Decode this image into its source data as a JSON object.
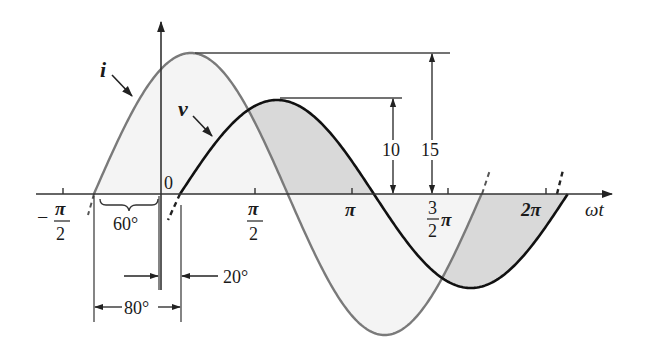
{
  "figure": {
    "type": "phasor-waveform-diagram",
    "axis": {
      "x_label": "ωt",
      "origin_label": "0",
      "ticks": [
        {
          "id": "neg_pi_half",
          "sign": "−",
          "num": "π",
          "den": "2"
        },
        {
          "id": "pi_half",
          "num": "π",
          "den": "2"
        },
        {
          "id": "pi",
          "label": "π"
        },
        {
          "id": "three_pi_half",
          "num": "3",
          "den": "2",
          "suffix": "π"
        },
        {
          "id": "two_pi",
          "label": "2π"
        }
      ]
    },
    "waveforms": {
      "current": {
        "label": "i",
        "amplitude": 15,
        "phase_deg": 60,
        "color": "#7a7a7a"
      },
      "voltage": {
        "label": "v",
        "amplitude": 10,
        "phase_deg": -20,
        "color": "#111111"
      }
    },
    "dimensions": {
      "voltage_peak": "10",
      "current_peak": "15",
      "current_lead_angle": "60°",
      "voltage_lag_angle": "20°",
      "phase_difference": "80°"
    },
    "colors": {
      "shading": "#dcdcdc",
      "axis": "#333333"
    }
  },
  "chart_data": {
    "type": "line",
    "title": "",
    "xlabel": "ωt",
    "ylabel": "",
    "x_ticks": [
      "−π/2",
      "0",
      "π/2",
      "π",
      "3π/2",
      "2π"
    ],
    "series": [
      {
        "name": "i",
        "function": "15 sin(ωt + 60°)",
        "amplitude": 15,
        "phase_deg": 60
      },
      {
        "name": "v",
        "function": "10 sin(ωt − 20°)",
        "amplitude": 10,
        "phase_deg": -20
      }
    ],
    "annotations": [
      "10",
      "15",
      "60°",
      "20°",
      "80°"
    ]
  }
}
